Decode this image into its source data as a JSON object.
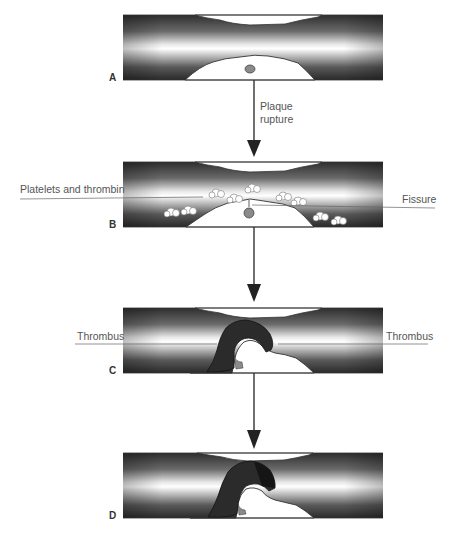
{
  "figure": {
    "panels": [
      {
        "id": "A",
        "label": "A"
      },
      {
        "id": "B",
        "label": "B"
      },
      {
        "id": "C",
        "label": "C"
      },
      {
        "id": "D",
        "label": "D"
      }
    ],
    "arrows": [
      {
        "from": "A",
        "to": "B",
        "label_line1": "Plaque",
        "label_line2": "rupture"
      },
      {
        "from": "B",
        "to": "C"
      },
      {
        "from": "C",
        "to": "D"
      }
    ],
    "annotations": {
      "platelets": "Platelets and thrombin",
      "fissure": "Fissure",
      "thrombus_left": "Thrombus",
      "thrombus_right": "Thrombus"
    },
    "colors": {
      "vessel_wall_dark": "#2a2a2a",
      "lumen_light": "#ffffff",
      "plaque": "#ffffff",
      "lipid_core": "#8a8a8a",
      "thrombus": "#2b2b2b",
      "line": "#444444"
    }
  }
}
